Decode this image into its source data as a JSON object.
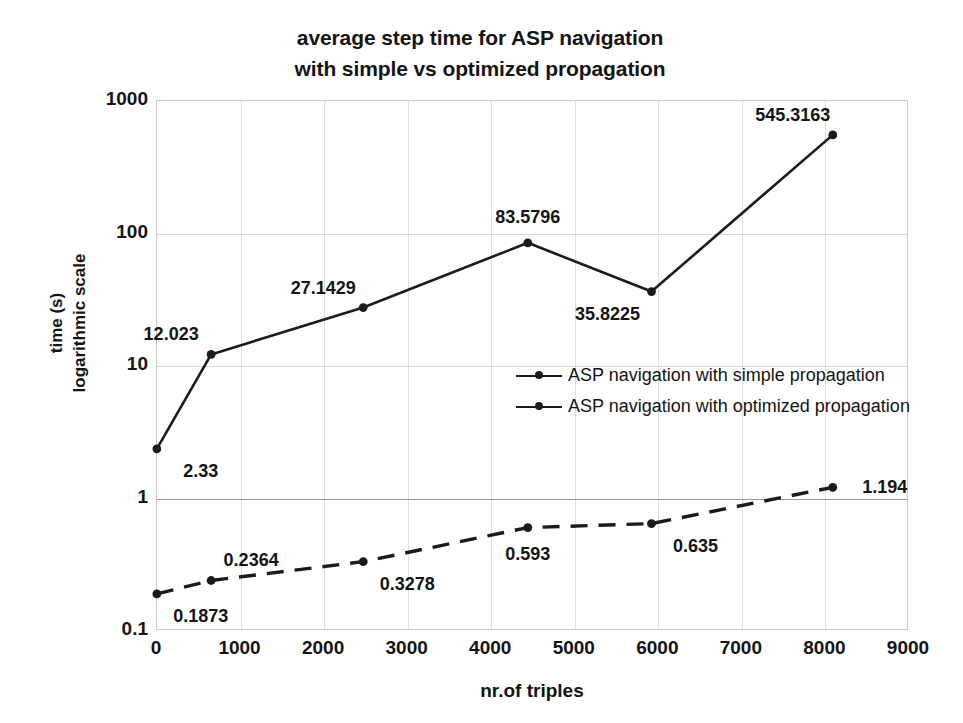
{
  "chart_data": {
    "type": "line",
    "title": "average step time for ASP navigation with simple vs optimized propagation",
    "title_lines": [
      "average step time for ASP navigation",
      "with simple vs optimized propagation"
    ],
    "xlabel": "nr.of triples",
    "ylabel": "time (s) logarithmic scale",
    "ylabel_lines": [
      "time (s)",
      "logarithmic scale"
    ],
    "yscale": "log",
    "xlim": [
      0,
      9000
    ],
    "ylim": [
      0.1,
      1000
    ],
    "grid": true,
    "legend_position": "center-right",
    "xticks": [
      "0",
      "1000",
      "2000",
      "3000",
      "4000",
      "5000",
      "6000",
      "7000",
      "8000",
      "9000"
    ],
    "xtick_values": [
      0,
      1000,
      2000,
      3000,
      4000,
      5000,
      6000,
      7000,
      8000,
      9000
    ],
    "yticks": [
      "0.1",
      "1",
      "10",
      "100",
      "1000"
    ],
    "ytick_values": [
      0.1,
      1,
      10,
      100,
      1000
    ],
    "series": [
      {
        "name": "ASP navigation with simple propagation",
        "style": "solid",
        "marker": "circle",
        "x": [
          10,
          660,
          2480,
          4450,
          5930,
          8100
        ],
        "values": [
          2.33,
          12.023,
          27.1429,
          83.5796,
          35.8225,
          545.3163
        ],
        "labels": [
          "2.33",
          "12.023",
          "27.1429",
          "83.5796",
          "35.8225",
          "545.3163"
        ],
        "label_positions": [
          "below-right",
          "above-left",
          "above-left",
          "above",
          "below-left",
          "above-left"
        ]
      },
      {
        "name": "ASP navigation with optimized propagation",
        "style": "dashed",
        "marker": "circle",
        "x": [
          10,
          660,
          2480,
          4450,
          5930,
          8100
        ],
        "values": [
          0.1873,
          0.2364,
          0.3278,
          0.593,
          0.635,
          1.194
        ],
        "labels": [
          "0.1873",
          "0.2364",
          "0.3278",
          "0.593",
          "0.635",
          "1.194"
        ],
        "label_positions": [
          "below-right",
          "above-right",
          "below-right",
          "below",
          "below-right",
          "right"
        ]
      }
    ]
  },
  "colors": {
    "series": "#1b1b1b",
    "grid": "#dedede",
    "axis": "#c9c9c9",
    "text": "#141414",
    "background": "#ffffff"
  }
}
